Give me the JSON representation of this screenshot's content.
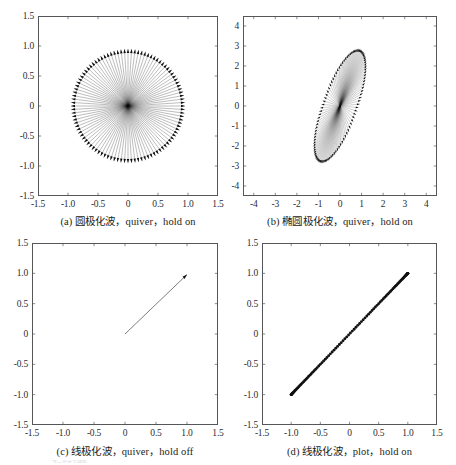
{
  "figure": {
    "background_color": "#ffffff",
    "axis_color": "#55575a",
    "data_color": "#111111",
    "panels": [
      {
        "id": "a",
        "caption": "(a) 圆极化波，quiver，hold on",
        "caption_prefix": "(a)",
        "caption_cn": "圆极化波",
        "caption_suffix": "，quiver，hold on",
        "xticks": [
          "-1.5",
          "-1.0",
          "-0.5",
          "0",
          "0.5",
          "1.0",
          "1.5"
        ],
        "yticks": [
          "1.5",
          "1.0",
          "0.5",
          "0",
          "-0.5",
          "-1.0",
          "-1.5"
        ],
        "xlim": [
          -1.5,
          1.5
        ],
        "ylim": [
          -1.5,
          1.5
        ]
      },
      {
        "id": "b",
        "caption": "(b) 椭圆极化波，quiver，hold on",
        "caption_prefix": "(b)",
        "caption_cn": "椭圆极化波",
        "caption_suffix": "，quiver，hold on",
        "xticks": [
          "-4",
          "-3",
          "-2",
          "-1",
          "0",
          "1",
          "2",
          "3",
          "4"
        ],
        "yticks": [
          "4",
          "3",
          "2",
          "1",
          "0",
          "-1",
          "-2",
          "-3",
          "-4"
        ],
        "xlim": [
          -4.5,
          4.5
        ],
        "ylim": [
          -4.5,
          4.5
        ]
      },
      {
        "id": "c",
        "caption": "(c) 线极化波，quiver，hold off",
        "caption_prefix": "(c)",
        "caption_cn": "线极化波",
        "caption_suffix": "，quiver，hold off",
        "xticks": [
          "-1.5",
          "-1.0",
          "-0.5",
          "0",
          "0.5",
          "1.0",
          "1.5"
        ],
        "yticks": [
          "1.5",
          "1.0",
          "0.5",
          "0",
          "-0.5",
          "-1.0",
          "-1.5"
        ],
        "xlim": [
          -1.5,
          1.5
        ],
        "ylim": [
          -1.5,
          1.5
        ]
      },
      {
        "id": "d",
        "caption": "(d) 线极化波，plot，hold on",
        "caption_prefix": "(d)",
        "caption_cn": "线极化波",
        "caption_suffix": "，plot，hold on",
        "xticks": [
          "-1.5",
          "-1.0",
          "-0.5",
          "0",
          "0.5",
          "1.0",
          "1.5"
        ],
        "yticks": [
          "1.5",
          "1.0",
          "0.5",
          "0",
          "-0.5",
          "-1.0",
          "-1.5"
        ],
        "xlim": [
          -1.5,
          1.5
        ],
        "ylim": [
          -1.5,
          1.5
        ]
      }
    ]
  },
  "page_bleed_text": "下一页文字残影",
  "chart_data": [
    {
      "id": "a",
      "type": "scatter",
      "title": "(a) 圆极化波，quiver，hold on",
      "plot_kind": "quiver-radial",
      "xlabel": "",
      "ylabel": "",
      "xlim": [
        -1.5,
        1.5
      ],
      "ylim": [
        -1.5,
        1.5
      ],
      "xticks": [
        -1.5,
        -1.0,
        -0.5,
        0,
        0.5,
        1.0,
        1.5
      ],
      "yticks": [
        -1.5,
        -1.0,
        -0.5,
        0,
        0.5,
        1.0,
        1.5
      ],
      "grid": false,
      "legend": "none",
      "description": "Circular polarization: ~100 arrows drawn from the origin, all of length ~0.95, at evenly spaced angles covering 0-360 degrees, forming a filled disc of vectors.",
      "arrow_count": 100,
      "radius": 0.95,
      "origin": [
        0,
        0
      ],
      "angle_start_deg": 0,
      "angle_step_deg": 3.6
    },
    {
      "id": "b",
      "type": "scatter",
      "title": "(b) 椭圆极化波，quiver，hold on",
      "plot_kind": "quiver-elliptical",
      "xlabel": "",
      "ylabel": "",
      "xlim": [
        -4.5,
        4.5
      ],
      "ylim": [
        -4.5,
        4.5
      ],
      "xticks": [
        -4,
        -3,
        -2,
        -1,
        0,
        1,
        2,
        3,
        4
      ],
      "yticks": [
        -4,
        -3,
        -2,
        -1,
        0,
        1,
        2,
        3,
        4
      ],
      "grid": false,
      "legend": "none",
      "description": "Elliptical polarization: ~100 arrows from the origin whose tips trace a tilted ellipse with semi-major axis ~3.0, semi-minor axis ~0.85, tilted about 72 degrees from the +x axis.",
      "arrow_count": 100,
      "semi_major": 3.0,
      "semi_minor": 0.85,
      "tilt_deg": 72,
      "origin": [
        0,
        0
      ]
    },
    {
      "id": "c",
      "type": "scatter",
      "title": "(c) 线极化波，quiver，hold off",
      "plot_kind": "quiver-single",
      "xlabel": "",
      "ylabel": "",
      "xlim": [
        -1.5,
        1.5
      ],
      "ylim": [
        -1.5,
        1.5
      ],
      "xticks": [
        -1.5,
        -1.0,
        -0.5,
        0,
        0.5,
        1.0,
        1.5
      ],
      "yticks": [
        -1.5,
        -1.0,
        -0.5,
        0,
        0.5,
        1.0,
        1.5
      ],
      "grid": false,
      "legend": "none",
      "description": "Linear polarization with hold off: only the final single arrow survives, drawn from (0,0) to (1,1).",
      "arrow_count": 1,
      "arrows": [
        {
          "from": [
            0,
            0
          ],
          "to": [
            1.0,
            0.98
          ]
        }
      ]
    },
    {
      "id": "d",
      "type": "scatter",
      "title": "(d) 线极化波，plot，hold on",
      "plot_kind": "marker-line",
      "xlabel": "",
      "ylabel": "",
      "xlim": [
        -1.5,
        1.5
      ],
      "ylim": [
        -1.5,
        1.5
      ],
      "xticks": [
        -1.5,
        -1.0,
        -0.5,
        0,
        0.5,
        1.0,
        1.5
      ],
      "yticks": [
        -1.5,
        -1.0,
        -0.5,
        0,
        0.5,
        1.0,
        1.5
      ],
      "grid": false,
      "legend": "none",
      "marker": "filled-circle",
      "description": "Linear polarization plotted as dot markers along the line y = x from (-1,-1) to (1,1); markers are sinusoidally spaced so they crowd together near both endpoints.",
      "marker_count": 100,
      "line_from": [
        -1,
        -1
      ],
      "line_to": [
        1,
        1
      ]
    }
  ]
}
